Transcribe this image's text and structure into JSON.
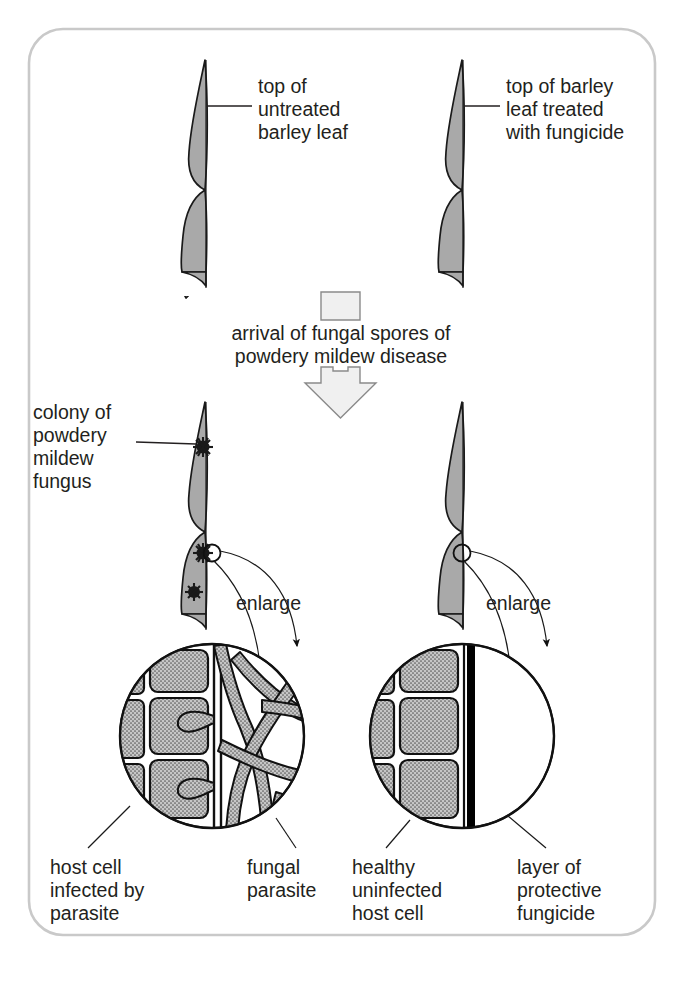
{
  "figure": {
    "border_color": "#c9c9c9",
    "leaf_fill": "#a9a9a9",
    "ink_color": "#231f20"
  },
  "labels": {
    "top_left": "top of\nuntreated\nbarley leaf",
    "top_left_lines": [
      "top of",
      "untreated",
      "barley leaf"
    ],
    "top_right_lines": [
      "top of barley",
      "leaf treated",
      "with fungicide"
    ],
    "process_lines": [
      "arrival of fungal spores of",
      "powdery mildew disease"
    ],
    "colony_lines": [
      "colony of",
      "powdery",
      "mildew",
      "fungus"
    ],
    "enlarge_left": "enlarge",
    "enlarge_right": "enlarge",
    "bottom_left_lines": [
      "host cell",
      "infected by",
      "parasite"
    ],
    "bottom_mid_lines": [
      "fungal",
      "parasite"
    ],
    "bottom_right_inner_lines": [
      "healthy",
      "uninfected",
      "host cell"
    ],
    "bottom_right_lines": [
      "layer of",
      "protective",
      "fungicide"
    ]
  },
  "panels": {
    "top": {
      "left_leaf": "untreated barley leaf",
      "right_leaf": "fungicide treated barley leaf"
    },
    "process_arrow": "downward block arrow indicating arrival of spores",
    "bottom": {
      "left_leaf": "infected untreated leaf with three mildew colonies",
      "left_colony_count": 3,
      "right_leaf": "treated leaf with no colonies",
      "right_marker": "small circle marking enlargement site"
    },
    "detail_left": {
      "caption": "infected leaf surface detail",
      "contents": [
        "epidermal host cells",
        "leaf surface",
        "fungal hyphae network",
        "haustoria penetrating host cells"
      ]
    },
    "detail_right": {
      "caption": "protected leaf surface detail",
      "contents": [
        "healthy epidermal host cells",
        "leaf surface",
        "black fungicide layer",
        "no fungal growth"
      ]
    }
  }
}
